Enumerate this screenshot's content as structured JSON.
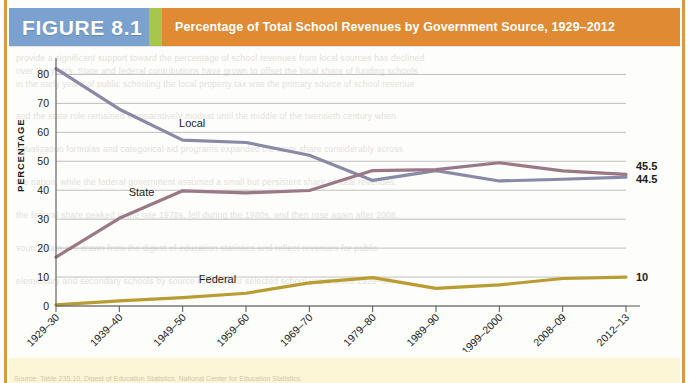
{
  "figure": {
    "badge_label": "FIGURE 8.1",
    "title": "Percentage of Total School Revenues by Government Source, 1929–2012"
  },
  "colors": {
    "banner_bg": "#e08a33",
    "badge_bg": "#7ba2cf",
    "divider": "#a6c64e",
    "page_rule": "#d99b3f",
    "local_line": "#8a8aa6",
    "state_line": "#9a7887",
    "federal_line": "#b99c32",
    "gridline": "#b9b9b9",
    "axis": "#555555",
    "source_strip": "#fbf3cf"
  },
  "axes": {
    "y_title": "PERCENTAGE",
    "x_title": "SCHOOL YEAR",
    "y_ticks": [
      "0",
      "10",
      "20",
      "30",
      "40",
      "50",
      "60",
      "70",
      "80"
    ],
    "y_min": 0,
    "y_max": 85,
    "grid": true
  },
  "series_labels": {
    "local": "Local",
    "state": "State",
    "federal": "Federal"
  },
  "end_labels": {
    "local": "44.5",
    "state": "45.5",
    "federal": "10"
  },
  "ghost_lines": {
    "l1": "provide a significant support toward the percentage of school revenues from local sources has declined",
    "l2": "over the years. State and federal contributions have grown to offset the local share of funding schools.",
    "l3": "in the early years of public schooling the local property tax was the primary source of school revenue",
    "l4": "and the state role remained comparatively modest until the middle of the twentieth century when",
    "l5": "equalization formulas and categorical aid programs expanded the state share considerably across",
    "l6": "the nation, while the federal government assumed a small but persistent share of total revenues.",
    "l7": "the federal share peaked in the late 1970s, fell during the 1980s, and then rose again after 2008.",
    "l8": "source data are drawn from the digest of education statistics and reflect revenues for public",
    "l9": "elementary and secondary schools by source of funds for selected school years since 1929–30."
  },
  "source_note": "Source: Table 235.10, Digest of Education Statistics, National Center for Education Statistics.",
  "chart_data": {
    "type": "line",
    "title": "Percentage of Total School Revenues by Government Source, 1929–2012",
    "xlabel": "SCHOOL YEAR",
    "ylabel": "PERCENTAGE",
    "ylim": [
      0,
      85
    ],
    "grid": true,
    "legend": "inline-labels",
    "categories": [
      "1929–30",
      "1939–40",
      "1949–50",
      "1959–60",
      "1969–70",
      "1979–80",
      "1989–90",
      "1999–2000",
      "2008–09",
      "2012–13"
    ],
    "series": [
      {
        "name": "Local",
        "color": "#8a8aa6",
        "values": [
          82.0,
          68.0,
          57.3,
          56.5,
          52.1,
          43.4,
          46.8,
          43.2,
          43.8,
          44.5
        ],
        "end_label": "44.5"
      },
      {
        "name": "State",
        "color": "#9a7887",
        "values": [
          16.9,
          30.3,
          39.8,
          39.1,
          39.9,
          46.8,
          47.1,
          49.5,
          46.7,
          45.5
        ],
        "end_label": "45.5"
      },
      {
        "name": "Federal",
        "color": "#b99c32",
        "values": [
          0.4,
          1.8,
          2.9,
          4.4,
          8.0,
          9.8,
          6.1,
          7.3,
          9.5,
          10.0
        ],
        "end_label": "10"
      }
    ]
  }
}
